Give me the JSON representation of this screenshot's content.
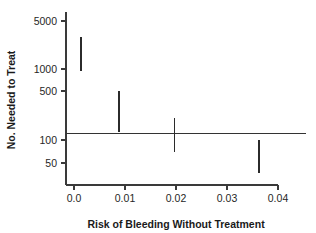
{
  "chart_data": {
    "type": "scatter",
    "title": "",
    "subtitle": "",
    "xlabel": "Risk of Bleeding Without Treatment",
    "ylabel": "No. Needed to Treat",
    "xlim": [
      -0.0015,
      0.0408
    ],
    "ylim": [
      30,
      6200
    ],
    "yscale": "log",
    "xscale": "linear",
    "grid": false,
    "legend": null,
    "xticks": [
      0,
      0.01,
      0.02,
      0.03,
      0.04
    ],
    "xticklabels": [
      "0.0",
      "0.01",
      "0.02",
      "0.03",
      "0.04"
    ],
    "yticks": [
      5000,
      1000,
      500,
      100,
      50
    ],
    "yticklabels": [
      "5000",
      "1000",
      "500",
      "100",
      "50"
    ],
    "reference_line": {
      "orientation": "horizontal",
      "y": 130,
      "label": ""
    },
    "series": [
      {
        "name": "Number needed to treat (95% CI)",
        "type": "interval",
        "points": [
          {
            "x": 0.0013,
            "low": 980,
            "high": 3000
          },
          {
            "x": 0.0088,
            "low": 135,
            "high": 520
          },
          {
            "x": 0.0197,
            "low": 72,
            "high": 215
          },
          {
            "x": 0.0363,
            "low": 36,
            "high": 105
          }
        ]
      }
    ]
  }
}
